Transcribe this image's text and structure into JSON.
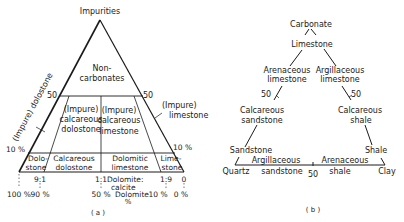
{
  "panel_a": {
    "caption": "( a )",
    "apex_label": "Impurities",
    "top_region": [
      "Non-",
      "carbonates"
    ],
    "left_edge_label": "(Impure) dolostone",
    "right_edge_label": [
      "(Impure)",
      "limestone"
    ],
    "tick_50_left": "50",
    "tick_50_right": "50",
    "tick_10_left": "10 %",
    "tick_10_right": "10 %",
    "middle_regions": {
      "impure_calc_dolostone": [
        "(Impure)",
        "calcareous",
        "dolostone"
      ],
      "impure_calc_limestone": [
        "(Impure)",
        "calcareous",
        "limestone"
      ]
    },
    "bottom_regions": {
      "dolostone": [
        "Dolo-",
        "stone"
      ],
      "calcareous_dolostone": [
        "Calcareous",
        "dolostone"
      ],
      "dolomitic_limestone": [
        "Dolomitic",
        "limestone"
      ],
      "limestone": [
        "Lime-",
        "stone"
      ]
    },
    "ratio_labels": [
      "9:1",
      "1:1",
      "1:9",
      "0"
    ],
    "ratio_axis_title": [
      "Dolomite:",
      "calcite"
    ],
    "percent_labels": [
      "100 %",
      "90 %",
      "50 %",
      "10 %",
      "0 %"
    ],
    "percent_axis_title": [
      "Dolomite",
      "%"
    ]
  },
  "panel_b": {
    "caption": "( b )",
    "apex_label": "Carbonate",
    "limestone": "Limestone",
    "arenaceous_limestone": [
      "Arenaceous",
      "limestone"
    ],
    "argillaceous_limestone": [
      "Argillaceous",
      "limestone"
    ],
    "tick_50_left": "50",
    "tick_50_right": "50",
    "calcareous_sandstone": [
      "Calcareous",
      "sandstone"
    ],
    "calcareous_shale": [
      "Calcareous",
      "shale"
    ],
    "sandstone": "Sandstone",
    "shale": "Shale",
    "argillaceous_sandstone": [
      "Argillaceous",
      "sandstone"
    ],
    "arenaceous_shale": [
      "Arenaceous",
      "shale"
    ],
    "base_tick_50": "50",
    "corner_left": "Quartz",
    "corner_right": "Clay"
  }
}
